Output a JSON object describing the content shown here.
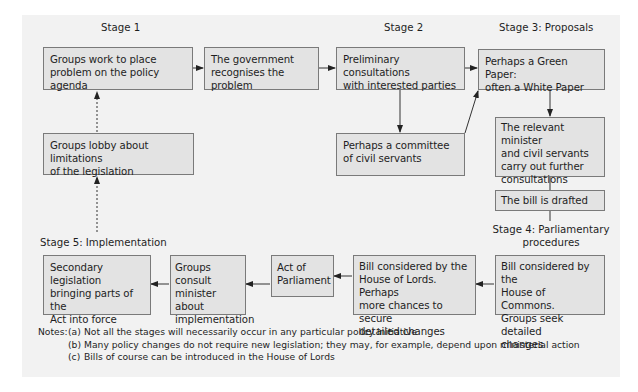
{
  "diagram": {
    "stages": {
      "stage1": "Stage 1",
      "stage2": "Stage 2",
      "stage3": "Stage 3: Proposals",
      "stage4": "Stage 4: Parliamentary\nprocedures",
      "stage5": "Stage 5: Implementation"
    },
    "boxes": {
      "groups_work": "Groups work to place\nproblem on the policy agenda",
      "gov_recognises": "The government\nrecognises the problem",
      "preliminary": "Preliminary consultations\nwith interested parties",
      "green_paper": "Perhaps a Green Paper:\noften a White Paper",
      "committee": "Perhaps a committee\nof civil servants",
      "lobby": "Groups lobby about limitations\nof the legislation",
      "minister": "The relevant minister\nand civil servants\ncarry out further\nconsultations",
      "drafted": "The bill is drafted",
      "secondary": "Secondary legislation\nbringing parts of the\nAct into force",
      "consult": "Groups consult\nminister about\nimplementation",
      "act": "Act of\nParliament",
      "lords": "Bill considered by the\nHouse of Lords. Perhaps\nmore chances to secure\ndetailed changes",
      "commons": "Bill considered by the\nHouse of Commons.\nGroups seek detailed\nchanges"
    },
    "notes": {
      "heading": "Notes:",
      "items": [
        {
          "key": "(a)",
          "text": "Not all the stages will necessarily occur in any particular policy initiative"
        },
        {
          "key": "(b)",
          "text": "Many policy changes do not require new legislation; they may, for example, depend upon ministerial action"
        },
        {
          "key": "(c)",
          "text": "Bills of course can be introduced in the House of Lords"
        }
      ]
    },
    "colors": {
      "panel": "#f2f2f2",
      "box_fill": "#e3e3e3",
      "border": "#7a7a7a",
      "line": "#333333"
    }
  }
}
